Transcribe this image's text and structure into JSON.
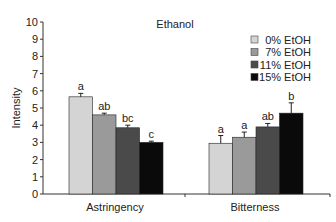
{
  "chart_data": {
    "type": "bar",
    "title": "Ethanol",
    "xlabel": "",
    "ylabel": "Intensity",
    "ylim": [
      0,
      10
    ],
    "yticks": [
      0,
      1,
      2,
      3,
      4,
      5,
      6,
      7,
      8,
      9,
      10
    ],
    "grid": false,
    "legend_position": "top-right",
    "categories": [
      "Astringency",
      "Bitterness"
    ],
    "series": [
      {
        "name": "0% EtOH",
        "color": "#d4d4d4",
        "values": [
          5.65,
          2.95
        ],
        "errors": [
          0.2,
          0.45
        ],
        "letters": [
          "a",
          "a"
        ]
      },
      {
        "name": "7% EtOH",
        "color": "#9a9a9a",
        "values": [
          4.6,
          3.3
        ],
        "errors": [
          0.1,
          0.3
        ],
        "letters": [
          "ab",
          "a"
        ]
      },
      {
        "name": "11% EtOH",
        "color": "#4a4a4a",
        "values": [
          3.85,
          3.9
        ],
        "errors": [
          0.15,
          0.2
        ],
        "letters": [
          "bc",
          "ab"
        ]
      },
      {
        "name": "15% EtOH",
        "color": "#0a0a0a",
        "values": [
          3.0,
          4.7
        ],
        "errors": [
          0.07,
          0.6
        ],
        "letters": [
          "c",
          "b"
        ]
      }
    ]
  }
}
